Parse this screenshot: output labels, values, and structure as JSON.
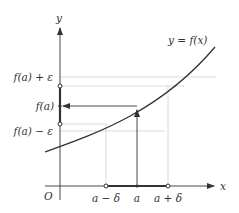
{
  "diagram": {
    "curve_label": "y = f(x)",
    "axes": {
      "x_label": "x",
      "y_label": "y",
      "origin_label": "O"
    },
    "y_ticks": [
      {
        "id": "fa-plus-eps",
        "label": "f(a) + ε"
      },
      {
        "id": "fa",
        "label": "f(a)"
      },
      {
        "id": "fa-minus-eps",
        "label": "f(a) − ε"
      }
    ],
    "x_ticks": [
      {
        "id": "a-minus-delta",
        "label": "a − δ"
      },
      {
        "id": "a",
        "label": "a"
      },
      {
        "id": "a-plus-delta",
        "label": "a + δ"
      }
    ],
    "colors": {
      "axis": "#333333",
      "curve": "#333333",
      "grid": "#c8c8c8",
      "text": "#333333"
    }
  }
}
